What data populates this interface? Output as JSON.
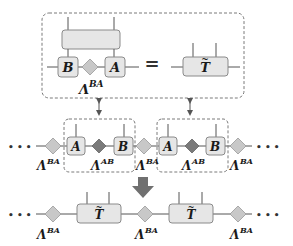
{
  "colors": {
    "tensor_fill": "#e6e6e6",
    "tensor_stroke": "#8a8a8a",
    "lambda_ba_fill": "#c8c8c8",
    "lambda_ab_fill": "#7a7a7a",
    "arrow_fill": "#707070",
    "wire": "#555555"
  },
  "top_equation": {
    "left": {
      "tensor_b": "B",
      "tensor_a": "A",
      "lambda_label": "Λ",
      "lambda_sup": "BA"
    },
    "equals": "=",
    "right": {
      "tensor_t": "T",
      "tilde": "~"
    }
  },
  "middle_row": {
    "ellipsis_left": "• • •",
    "ellipsis_right": "• • •",
    "lambda_ba_label": "Λ",
    "lambda_ba_sup": "BA",
    "lambda_ab_label": "Λ",
    "lambda_ab_sup": "AB",
    "tensor_a": "A",
    "tensor_b": "B"
  },
  "bottom_row": {
    "ellipsis_left": "• • •",
    "ellipsis_right": "• • •",
    "lambda_label": "Λ",
    "lambda_sup": "BA",
    "tensor_t": "T",
    "tilde": "~"
  }
}
